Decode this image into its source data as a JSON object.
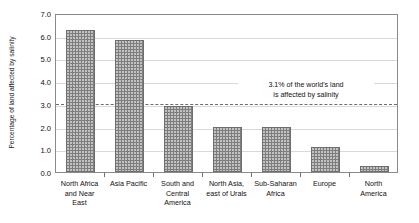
{
  "chart_data": {
    "type": "bar",
    "title": "",
    "xlabel": "",
    "ylabel": "Percentage of land affected by salinity",
    "ylim": [
      0.0,
      7.0
    ],
    "ytick_labels": [
      "7.0",
      "6.0",
      "5.0",
      "4.0",
      "3.0",
      "2.0",
      "1.0",
      "0.0"
    ],
    "ytick_values": [
      7.0,
      6.0,
      5.0,
      4.0,
      3.0,
      2.0,
      1.0,
      0.0
    ],
    "grid": "horizontal",
    "legend": "none",
    "categories": [
      "North Africa and Near East",
      "Asia Pacific",
      "South and Central America",
      "North Asia, east of Urals",
      "Sub-Saharan Africa",
      "Europe",
      "North America"
    ],
    "category_label_lines": [
      [
        "North Africa",
        "and Near",
        "East"
      ],
      [
        "Asia Pacific"
      ],
      [
        "South and",
        "Central",
        "America"
      ],
      [
        "North Asia,",
        "east of Urals"
      ],
      [
        "Sub-Saharan",
        "Africa"
      ],
      [
        "Europe"
      ],
      [
        "North",
        "America"
      ]
    ],
    "values": [
      6.25,
      5.8,
      2.9,
      2.0,
      2.0,
      1.1,
      0.25
    ],
    "bar_color": "#7e7e7e",
    "reference_line": {
      "value": 3.1,
      "style": "dashed",
      "color": "#6d6d6d",
      "annotation_lines": [
        "3.1% of the world's land",
        "is affected by salinity"
      ]
    }
  }
}
